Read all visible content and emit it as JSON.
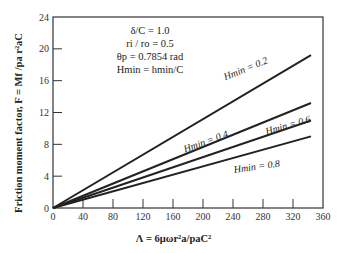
{
  "chart_data": {
    "type": "line",
    "title": "",
    "xlabel": "Λ = 6μωr_a²/p_aC²",
    "ylabel": "Friction moment factor, F = M_f/p_a r_a²C",
    "xlim": [
      0,
      360
    ],
    "ylim": [
      0,
      24
    ],
    "xticks": [
      0,
      40,
      80,
      120,
      160,
      200,
      240,
      280,
      320,
      360
    ],
    "yticks": [
      0,
      4,
      8,
      12,
      16,
      20,
      24
    ],
    "grid": false,
    "annotations": [
      "δ/C = 1.0",
      "r_i / r_o = 0.5",
      "θ_p = 0.7854 rad",
      "H_min = h_min/C"
    ],
    "series": [
      {
        "name": "H_min = 0.2",
        "x": [
          0,
          344
        ],
        "y": [
          0,
          19.2
        ]
      },
      {
        "name": "H_min = 0.4",
        "x": [
          0,
          344
        ],
        "y": [
          0,
          13.2
        ]
      },
      {
        "name": "H_min = 0.6",
        "x": [
          0,
          344
        ],
        "y": [
          0,
          11.0
        ]
      },
      {
        "name": "H_min = 0.8",
        "x": [
          0,
          344
        ],
        "y": [
          0,
          9.0
        ]
      }
    ]
  },
  "labels": {
    "ylabel": "Friction moment factor, F = Mf /pa r²aC",
    "xlabel": "Λ = 6μωr²a/paC²",
    "params": [
      "δ/C = 1.0",
      "ri / ro = 0.5",
      "θp = 0.7854 rad",
      "Hmin = hmin/C"
    ],
    "curve_labels": [
      "Hmin = 0.2",
      "Hmin = 0.4",
      "Hmin = 0.6",
      "Hmin = 0.8"
    ]
  }
}
